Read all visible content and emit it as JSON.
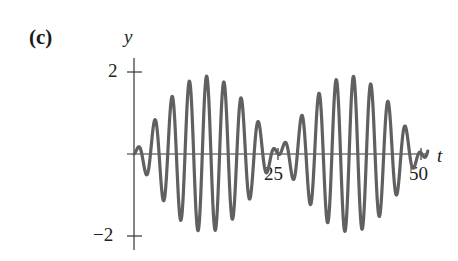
{
  "figure": {
    "panel_label": "(c)",
    "y_axis_label": "y",
    "x_axis_label": "t",
    "y_ticks": [
      "2",
      "−2"
    ],
    "x_ticks": [
      "25",
      "50"
    ]
  },
  "colors": {
    "curve": "#606060",
    "axis": "#333333"
  },
  "chart_data": {
    "type": "line",
    "title": "(c)",
    "xlabel": "t",
    "ylabel": "y",
    "xlim": [
      0,
      51
    ],
    "ylim": [
      -2,
      2
    ],
    "x_ticks": [
      25,
      50
    ],
    "y_ticks": [
      -2,
      2
    ],
    "grid": false,
    "legend": null,
    "series": [
      {
        "name": "y(t) beat oscillation",
        "description": "Amplitude-modulated oscillation (beats): carrier period ~3, envelope ~1.9*|sin(pi*t/25)|, envelope nodes at t=0, 25, 50",
        "envelope_peak_amplitude": 1.9,
        "carrier_period": 3.0,
        "envelope_period": 50,
        "node_times": [
          0,
          25,
          50
        ],
        "max_amplitude_times": [
          12.5,
          37.5
        ]
      }
    ]
  }
}
